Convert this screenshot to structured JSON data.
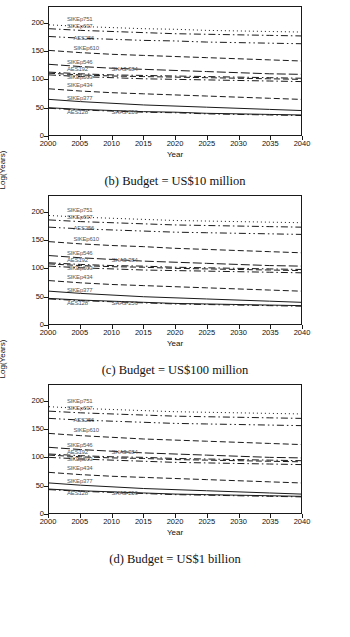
{
  "document": {
    "type": "figure-panel",
    "panel_count": 3
  },
  "axis": {
    "ylabel": "Log(Years)",
    "xlabel": "Year",
    "yticks": [
      0,
      50,
      100,
      150,
      200
    ],
    "xticks": [
      2000,
      2005,
      2010,
      2015,
      2020,
      2025,
      2030,
      2035,
      2040
    ],
    "ylim": [
      0,
      230
    ],
    "xlim": [
      2000,
      2040
    ]
  },
  "chart_data": [
    {
      "type": "line",
      "id": "panel-b",
      "title": "(b) Budget = US$10 million",
      "xlabel": "Year",
      "ylabel": "Log(Years)",
      "xlim": [
        2000,
        2040
      ],
      "ylim": [
        0,
        230
      ],
      "xticks": [
        2000,
        2005,
        2010,
        2015,
        2020,
        2025,
        2030,
        2035,
        2040
      ],
      "yticks": [
        0,
        50,
        100,
        150,
        200
      ],
      "grid": false,
      "legend": "inline-annotations",
      "x": [
        2000,
        2005,
        2010,
        2015,
        2020,
        2025,
        2030,
        2035,
        2040
      ],
      "series": [
        {
          "name": "SIKEp751",
          "dash": "dotted",
          "values": [
            198,
            195,
            193,
            191,
            190,
            188,
            187,
            186,
            185
          ]
        },
        {
          "name": "SIKEp697",
          "dash": "dashdot",
          "values": [
            191,
            188,
            186,
            184,
            182,
            181,
            180,
            179,
            178
          ]
        },
        {
          "name": "AES256",
          "dash": "dashdotdot",
          "values": [
            177,
            174,
            172,
            170,
            169,
            167,
            166,
            165,
            164
          ]
        },
        {
          "name": "SIKEp610",
          "dash": "dashed",
          "values": [
            152,
            148,
            145,
            143,
            141,
            139,
            137,
            135,
            133
          ]
        },
        {
          "name": "SIKEp546",
          "dash": "longdash",
          "values": [
            127,
            123,
            120,
            118,
            116,
            114,
            112,
            110,
            109
          ]
        },
        {
          "name": "AES192",
          "dash": "dashdot",
          "values": [
            113,
            110,
            108,
            107,
            106,
            105,
            104,
            103,
            102
          ]
        },
        {
          "name": "SHA3-384",
          "dash": "dashed",
          "values": [
            111,
            108,
            106,
            105,
            104,
            103,
            102,
            101,
            100
          ]
        },
        {
          "name": "SIKEp503",
          "dash": "dashdot",
          "values": [
            108,
            105,
            103,
            101,
            100,
            99,
            98,
            97,
            96
          ]
        },
        {
          "name": "SIKEp434",
          "dash": "dashed",
          "values": [
            83,
            79,
            76,
            74,
            72,
            70,
            68,
            66,
            64
          ]
        },
        {
          "name": "SIKEp377",
          "dash": "solid",
          "values": [
            64,
            60,
            57,
            54,
            52,
            50,
            48,
            46,
            44
          ]
        },
        {
          "name": "AES128",
          "dash": "solid",
          "values": [
            49,
            46,
            44,
            42,
            41,
            39,
            38,
            37,
            36
          ]
        },
        {
          "name": "SHA3-256",
          "dash": "dashdot",
          "values": [
            48,
            45,
            43,
            41,
            40,
            38,
            37,
            36,
            35
          ]
        }
      ]
    },
    {
      "type": "line",
      "id": "panel-c",
      "title": "(c) Budget = US$100 million",
      "xlabel": "Year",
      "ylabel": "Log(Years)",
      "xlim": [
        2000,
        2040
      ],
      "ylim": [
        0,
        230
      ],
      "xticks": [
        2000,
        2005,
        2010,
        2015,
        2020,
        2025,
        2030,
        2035,
        2040
      ],
      "yticks": [
        0,
        50,
        100,
        150,
        200
      ],
      "grid": false,
      "legend": "inline-annotations",
      "x": [
        2000,
        2005,
        2010,
        2015,
        2020,
        2025,
        2030,
        2035,
        2040
      ],
      "series": [
        {
          "name": "SIKEp751",
          "dash": "dotted",
          "values": [
            195,
            192,
            190,
            188,
            186,
            185,
            184,
            183,
            182
          ]
        },
        {
          "name": "SIKEp697",
          "dash": "dashdot",
          "values": [
            187,
            184,
            182,
            180,
            178,
            177,
            176,
            175,
            174
          ]
        },
        {
          "name": "AES256",
          "dash": "dashdotdot",
          "values": [
            174,
            171,
            169,
            167,
            165,
            164,
            163,
            162,
            161
          ]
        },
        {
          "name": "SIKEp610",
          "dash": "dashed",
          "values": [
            148,
            144,
            141,
            139,
            136,
            134,
            132,
            130,
            128
          ]
        },
        {
          "name": "SIKEp546",
          "dash": "longdash",
          "values": [
            123,
            119,
            116,
            113,
            111,
            109,
            107,
            105,
            104
          ]
        },
        {
          "name": "AES192",
          "dash": "dashdot",
          "values": [
            110,
            107,
            105,
            104,
            102,
            101,
            100,
            99,
            98
          ]
        },
        {
          "name": "SHA3-384",
          "dash": "dashed",
          "values": [
            108,
            105,
            103,
            102,
            100,
            99,
            98,
            97,
            96
          ]
        },
        {
          "name": "SIKEp503",
          "dash": "dashdot",
          "values": [
            104,
            101,
            99,
            97,
            96,
            95,
            94,
            93,
            92
          ]
        },
        {
          "name": "SIKEp434",
          "dash": "dashed",
          "values": [
            78,
            74,
            71,
            69,
            67,
            65,
            63,
            61,
            59
          ]
        },
        {
          "name": "SIKEp377",
          "dash": "solid",
          "values": [
            59,
            55,
            52,
            49,
            47,
            45,
            43,
            41,
            39
          ]
        },
        {
          "name": "AES128",
          "dash": "solid",
          "values": [
            46,
            43,
            41,
            39,
            37,
            36,
            35,
            34,
            33
          ]
        },
        {
          "name": "SHA3-256",
          "dash": "dashdot",
          "values": [
            45,
            42,
            40,
            38,
            36,
            35,
            34,
            33,
            32
          ]
        }
      ]
    },
    {
      "type": "line",
      "id": "panel-d",
      "title": "(d) Budget = US$1 billion",
      "xlabel": "Year",
      "ylabel": "Log(Years)",
      "xlim": [
        2000,
        2040
      ],
      "ylim": [
        0,
        230
      ],
      "xticks": [
        2000,
        2005,
        2010,
        2015,
        2020,
        2025,
        2030,
        2035,
        2040
      ],
      "yticks": [
        0,
        50,
        100,
        150,
        200
      ],
      "grid": false,
      "legend": "inline-annotations",
      "x": [
        2000,
        2005,
        2010,
        2015,
        2020,
        2025,
        2030,
        2035,
        2040
      ],
      "series": [
        {
          "name": "SIKEp751",
          "dash": "dotted",
          "values": [
            191,
            188,
            186,
            184,
            182,
            181,
            180,
            179,
            178
          ]
        },
        {
          "name": "SIKEp697",
          "dash": "dashdot",
          "values": [
            183,
            180,
            178,
            176,
            174,
            173,
            172,
            171,
            170
          ]
        },
        {
          "name": "AES256",
          "dash": "dashdotdot",
          "values": [
            170,
            167,
            165,
            163,
            161,
            160,
            159,
            158,
            157
          ]
        },
        {
          "name": "SIKEp610",
          "dash": "dashed",
          "values": [
            143,
            139,
            136,
            133,
            131,
            129,
            127,
            125,
            123
          ]
        },
        {
          "name": "SIKEp546",
          "dash": "longdash",
          "values": [
            118,
            114,
            111,
            108,
            106,
            104,
            102,
            100,
            99
          ]
        },
        {
          "name": "AES192",
          "dash": "dashdot",
          "values": [
            106,
            103,
            101,
            100,
            98,
            97,
            96,
            95,
            94
          ]
        },
        {
          "name": "SHA3-384",
          "dash": "dashed",
          "values": [
            104,
            101,
            99,
            98,
            96,
            95,
            94,
            93,
            92
          ]
        },
        {
          "name": "SIKEp503",
          "dash": "dashdot",
          "values": [
            100,
            97,
            95,
            93,
            91,
            90,
            89,
            88,
            87
          ]
        },
        {
          "name": "SIKEp434",
          "dash": "dashed",
          "values": [
            73,
            69,
            66,
            64,
            62,
            60,
            58,
            56,
            54
          ]
        },
        {
          "name": "SIKEp377",
          "dash": "solid",
          "values": [
            54,
            50,
            47,
            44,
            42,
            40,
            38,
            36,
            34
          ]
        },
        {
          "name": "AES128",
          "dash": "solid",
          "values": [
            43,
            40,
            38,
            36,
            34,
            33,
            32,
            31,
            30
          ]
        },
        {
          "name": "SHA3-256",
          "dash": "dashdot",
          "values": [
            42,
            39,
            37,
            35,
            33,
            32,
            31,
            30,
            29
          ]
        }
      ]
    }
  ],
  "annotations": {
    "panel-b": [
      {
        "text": "SIKEp751",
        "x": 2003,
        "y": 205
      },
      {
        "text": "SIKEp697",
        "x": 2003,
        "y": 192
      },
      {
        "text": "AES256",
        "x": 2004,
        "y": 172
      },
      {
        "text": "SIKEp610",
        "x": 2004,
        "y": 154
      },
      {
        "text": "SIKEp546",
        "x": 2003,
        "y": 129
      },
      {
        "text": "AES192",
        "x": 2003,
        "y": 116
      },
      {
        "text": "SHA3-384",
        "x": 2010,
        "y": 116
      },
      {
        "text": "SIKEp503",
        "x": 2003,
        "y": 103
      },
      {
        "text": "SIKEp434",
        "x": 2003,
        "y": 89
      },
      {
        "text": "SIKEp377",
        "x": 2003,
        "y": 66
      },
      {
        "text": "AES128",
        "x": 2003,
        "y": 41
      },
      {
        "text": "SHA3-256",
        "x": 2010,
        "y": 41
      }
    ],
    "panel-c": [
      {
        "text": "SIKEp751",
        "x": 2003,
        "y": 202
      },
      {
        "text": "SIKEp697",
        "x": 2003,
        "y": 189
      },
      {
        "text": "AES256",
        "x": 2004,
        "y": 169
      },
      {
        "text": "SIKEp610",
        "x": 2004,
        "y": 151
      },
      {
        "text": "SIKEp546",
        "x": 2003,
        "y": 125
      },
      {
        "text": "AES192",
        "x": 2003,
        "y": 113
      },
      {
        "text": "SHA3-384",
        "x": 2010,
        "y": 113
      },
      {
        "text": "SIKEp503",
        "x": 2003,
        "y": 99
      },
      {
        "text": "SIKEp434",
        "x": 2003,
        "y": 84
      },
      {
        "text": "SIKEp377",
        "x": 2003,
        "y": 61
      },
      {
        "text": "AES128",
        "x": 2003,
        "y": 38
      },
      {
        "text": "SHA3-256",
        "x": 2010,
        "y": 38
      }
    ],
    "panel-d": [
      {
        "text": "SIKEp751",
        "x": 2003,
        "y": 198
      },
      {
        "text": "SIKEp697",
        "x": 2003,
        "y": 185
      },
      {
        "text": "AES256",
        "x": 2004,
        "y": 165
      },
      {
        "text": "SIKEp610",
        "x": 2004,
        "y": 147
      },
      {
        "text": "SIKEp546",
        "x": 2003,
        "y": 120
      },
      {
        "text": "AES192",
        "x": 2003,
        "y": 108
      },
      {
        "text": "SHA3-384",
        "x": 2010,
        "y": 108
      },
      {
        "text": "SIKEp503",
        "x": 2003,
        "y": 95
      },
      {
        "text": "SIKEp434",
        "x": 2003,
        "y": 80
      },
      {
        "text": "SIKEp377",
        "x": 2003,
        "y": 57
      },
      {
        "text": "AES128",
        "x": 2003,
        "y": 35
      },
      {
        "text": "SHA3-256",
        "x": 2010,
        "y": 35
      }
    ]
  },
  "colors": {
    "line": "#1a1a1a",
    "axis": "#1a1a1a",
    "label": "#555555",
    "background": "#ffffff"
  }
}
